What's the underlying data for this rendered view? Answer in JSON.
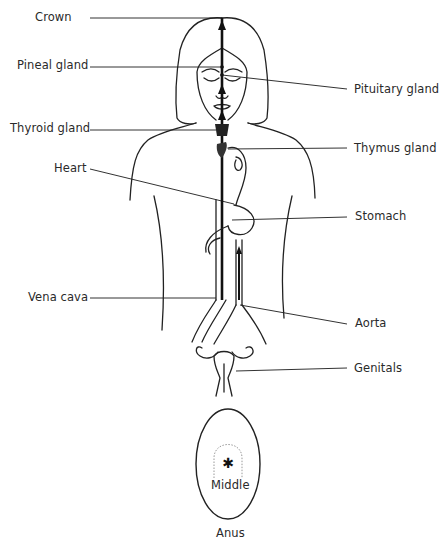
{
  "diagram": {
    "type": "anatomical-energy-channel",
    "labels": {
      "crown": "Crown",
      "pineal": "Pineal gland",
      "pituitary": "Pituitary gland",
      "thyroid": "Thyroid gland",
      "thymus": "Thymus gland",
      "heart": "Heart",
      "stomach": "Stomach",
      "vena_cava": "Vena cava",
      "aorta": "Aorta",
      "genitals": "Genitals",
      "middle": "Middle",
      "anus": "Anus"
    }
  }
}
